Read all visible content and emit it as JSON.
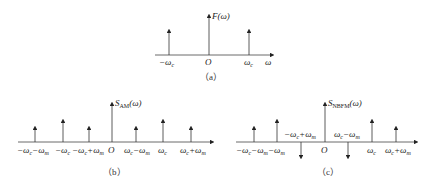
{
  "panels": {
    "a": {
      "caption": "(a)",
      "ylabel": "F(ω)",
      "xlabel": "ω",
      "origin": "O",
      "ticks": [
        "-ωc",
        "O",
        "ωc"
      ],
      "impulses": [
        {
          "label": "-ωc",
          "direction": "up",
          "height": "medium"
        },
        {
          "label": "0",
          "direction": "up",
          "height": "tall"
        },
        {
          "label": "ωc",
          "direction": "up",
          "height": "medium"
        }
      ]
    },
    "b": {
      "caption": "(b)",
      "ylabel": "S_AM(ω)",
      "origin": "O",
      "ticks": [
        "-ωc-ωm",
        "-ωc",
        "-ωc+ωm",
        "O",
        "ωc-ωm",
        "ωc",
        "ωc+ωm"
      ],
      "impulses": [
        {
          "label": "-ωc-ωm",
          "direction": "up",
          "height": "short"
        },
        {
          "label": "-ωc",
          "direction": "up",
          "height": "medium"
        },
        {
          "label": "-ωc+ωm",
          "direction": "up",
          "height": "short"
        },
        {
          "label": "0",
          "direction": "up",
          "height": "tall"
        },
        {
          "label": "ωc-ωm",
          "direction": "up",
          "height": "short"
        },
        {
          "label": "ωc",
          "direction": "up",
          "height": "medium"
        },
        {
          "label": "ωc+ωm",
          "direction": "up",
          "height": "short"
        }
      ]
    },
    "c": {
      "caption": "(c)",
      "ylabel": "S_NBFM(ω)",
      "origin": "O",
      "ticks": [
        "-ωc-ωm",
        "-ωm",
        "-ωc+ωm",
        "O",
        "ωc-ωm",
        "ωc",
        "ωc+ωm"
      ],
      "impulses": [
        {
          "label": "-ωc-ωm",
          "direction": "up",
          "height": "short"
        },
        {
          "label": "-ωc",
          "direction": "up",
          "height": "medium"
        },
        {
          "label": "-ωc+ωm",
          "direction": "down",
          "height": "short"
        },
        {
          "label": "0",
          "direction": "up",
          "height": "tall"
        },
        {
          "label": "ωc-ωm",
          "direction": "down",
          "height": "short"
        },
        {
          "label": "ωc",
          "direction": "up",
          "height": "medium"
        },
        {
          "label": "ωc+ωm",
          "direction": "up",
          "height": "short"
        }
      ]
    }
  },
  "text": {
    "a_caption": "（a）",
    "b_caption": "（b）",
    "c_caption": "（c）",
    "F": "F(ω)",
    "S": "S",
    "AM": "AM",
    "NBFM": "NBFM",
    "omega_paren": "(ω)",
    "O": "O",
    "omega": "ω"
  }
}
